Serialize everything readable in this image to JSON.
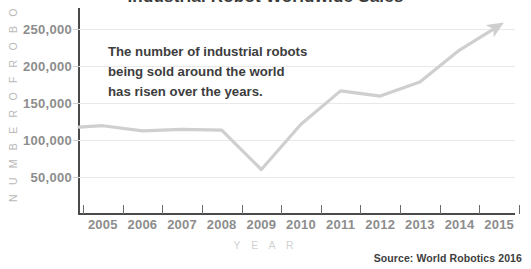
{
  "chart_data": {
    "type": "line",
    "title": "Industrial Robot Worldwide Sales",
    "xlabel": "Y E A R",
    "ylabel": "N U M B E R   O F   R O B O T S",
    "categories": [
      "2005",
      "2006",
      "2007",
      "2008",
      "2009",
      "2010",
      "2011",
      "2012",
      "2013",
      "2014",
      "2015"
    ],
    "x": [
      2005,
      2006,
      2007,
      2008,
      2009,
      2010,
      2011,
      2012,
      2013,
      2014,
      2015
    ],
    "values": [
      119000,
      112000,
      114000,
      113000,
      60000,
      121000,
      166000,
      159000,
      178000,
      221000,
      254000
    ],
    "series": [
      {
        "name": "Industrial robots sold worldwide",
        "values": [
          119000,
          112000,
          114000,
          113000,
          60000,
          121000,
          166000,
          159000,
          178000,
          221000,
          254000
        ]
      }
    ],
    "y_ticks": [
      50000,
      100000,
      150000,
      200000,
      250000
    ],
    "y_tick_labels": [
      "50,000",
      "100,000",
      "150,000",
      "200,000",
      "250,000"
    ],
    "ylim": [
      0,
      275000
    ],
    "xlim": [
      2004.4,
      2015.4
    ],
    "grid": true,
    "legend": false,
    "line_color": "#cfcfcf",
    "line_has_end_arrow": true,
    "annotations": [
      "The number of industrial robots",
      "being sold around the world",
      "has risen over the years."
    ],
    "source_note": "Source: World Robotics 2016"
  },
  "labels": {
    "title": "Industrial Robot Worldwide Sales",
    "y_caption": "N U M B E R   O F   R O B O T S",
    "x_caption": "Y E A R",
    "annotation_line1": "The number of industrial robots",
    "annotation_line2": "being sold around the world",
    "annotation_line3": "has risen over the years.",
    "source": "Source: World Robotics 2016"
  },
  "colors": {
    "line": "#cfcfcf",
    "grid": "#e9e9e9",
    "axis": "#4a4a4a",
    "tick_text": "#8d8d8d",
    "caption_text": "#c4c4c4",
    "annotation_text": "#3d3d3d"
  }
}
